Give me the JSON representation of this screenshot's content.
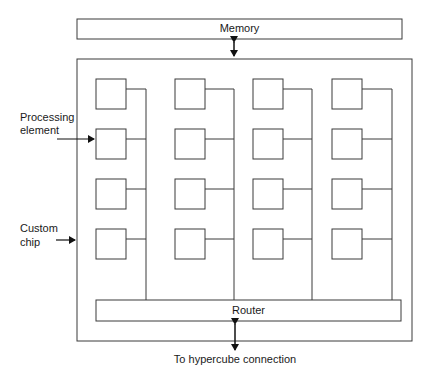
{
  "diagram": {
    "memory": {
      "label": "Memory"
    },
    "router": {
      "label": "Router"
    },
    "labels": {
      "processing_element_line1": "Processing",
      "processing_element_line2": "element",
      "custom_chip_line1": "Custom",
      "custom_chip_line2": "chip",
      "hypercube": "To hypercube connection"
    },
    "grid": {
      "columns": 4,
      "rows": 4
    },
    "colors": {
      "stroke": "#3a3a3a",
      "background": "#ffffff"
    }
  }
}
